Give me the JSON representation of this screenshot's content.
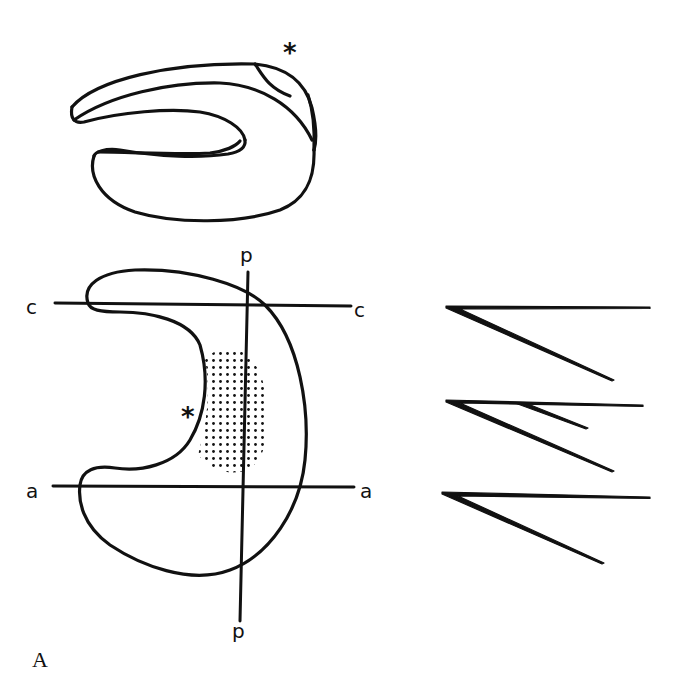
{
  "figure": {
    "panel_label": "A",
    "top_drawing": {
      "description": "3D view of C-shaped (crescent) structure",
      "marker": "*"
    },
    "bottom_drawing": {
      "description": "Crescent outline with cross-section planes and stippled region",
      "marker": "*",
      "lines": {
        "c_left": "c",
        "c_right": "c",
        "a_left": "a",
        "a_right": "a",
        "p_top": "p",
        "p_bottom": "p"
      }
    },
    "sections": {
      "description": "Cross-section profiles at levels c, p, a",
      "count": 3
    }
  },
  "colors": {
    "ink": "#111111",
    "background": "#ffffff"
  }
}
